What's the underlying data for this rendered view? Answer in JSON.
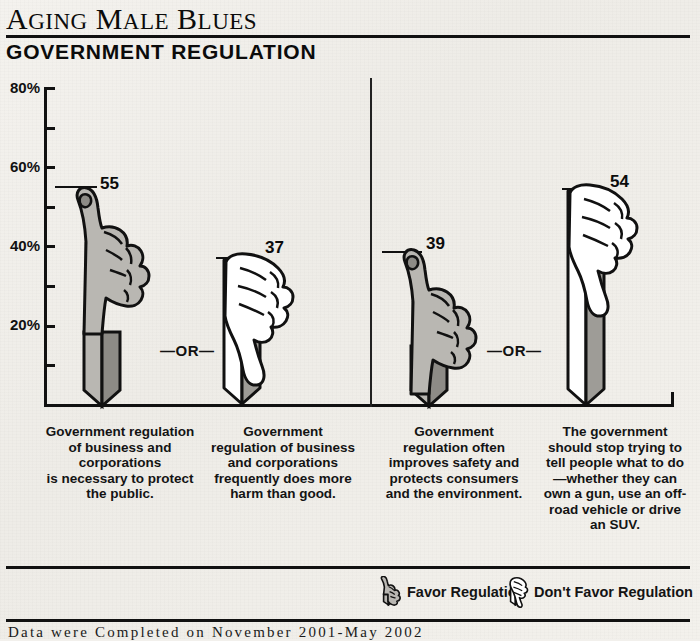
{
  "header": {
    "title_full": "Aging Male Blues",
    "title_words": [
      "AGING",
      "MALE",
      "BLUES"
    ],
    "subtitle": "GOVERNMENT REGULATION"
  },
  "axis": {
    "labels": [
      "80%",
      "60%",
      "40%",
      "20%"
    ],
    "max": 80,
    "unit": "%"
  },
  "separators": {
    "or_label": "—OR—"
  },
  "legend": {
    "favor": {
      "label": "Favor Regulation",
      "icon": "thumbs-up-icon"
    },
    "oppose": {
      "label": "Don't Favor Regulation",
      "icon": "thumbs-down-icon"
    }
  },
  "source": "Data were Completed on November 2001-May 2002",
  "colors": {
    "ink": "#111111",
    "paper": "#f2f0ec",
    "favor_light": "#b9b7b2",
    "favor_dark": "#8d8b86",
    "oppose_light": "#ffffff",
    "oppose_dark": "#9e9c97"
  },
  "chart_data": {
    "type": "bar",
    "title": "GOVERNMENT REGULATION",
    "xlabel": "",
    "ylabel": "",
    "ylim": [
      0,
      80
    ],
    "grid": false,
    "legend_position": "bottom-right",
    "tick_labels": [
      "20%",
      "40%",
      "60%",
      "80%"
    ],
    "tick_values": [
      20,
      40,
      60,
      80
    ],
    "minor_tick_interval": 10,
    "categories": [
      "Government regulation of business and corporations is necessary to protect the public.",
      "Government regulation of business and corporations frequently does more harm than good.",
      "Government regulation often improves safety and protects consumers and the environment.",
      "The government should stop trying to tell people what to do —whether they can own a gun, use an off-road vehicle or drive an SUV."
    ],
    "values": [
      55,
      37,
      39,
      54
    ],
    "series": [
      {
        "name": "Percent agreeing",
        "values": [
          55,
          37,
          39,
          54
        ]
      }
    ],
    "groups": [
      {
        "pair": [
          "Favor Regulation",
          "Don't Favor Regulation"
        ],
        "values": [
          55,
          37
        ]
      },
      {
        "pair": [
          "Favor Regulation",
          "Don't Favor Regulation"
        ],
        "values": [
          39,
          54
        ]
      }
    ],
    "annotations": [
      "—OR—",
      "—OR—"
    ]
  },
  "bars": [
    {
      "value": 55,
      "value_label": "55",
      "icon": "thumbs-up-icon",
      "sentiment": "favor",
      "caption_lines": [
        "Government regulation",
        "of business and",
        "corporations",
        "is necessary to protect",
        "the public."
      ]
    },
    {
      "value": 37,
      "value_label": "37",
      "icon": "thumbs-down-icon",
      "sentiment": "oppose",
      "caption_lines": [
        "Government",
        "regulation of business",
        "and corporations",
        "frequently does more",
        "harm than good."
      ]
    },
    {
      "value": 39,
      "value_label": "39",
      "icon": "thumbs-up-icon",
      "sentiment": "favor",
      "caption_lines": [
        "Government",
        "regulation often",
        "improves safety and",
        "protects consumers",
        "and the environment."
      ]
    },
    {
      "value": 54,
      "value_label": "54",
      "icon": "thumbs-down-icon",
      "sentiment": "oppose",
      "caption_lines": [
        "The government",
        "should stop trying to",
        "tell people what to do",
        "—whether they can",
        "own a gun, use an off-",
        "road vehicle or drive",
        "an SUV."
      ]
    }
  ]
}
